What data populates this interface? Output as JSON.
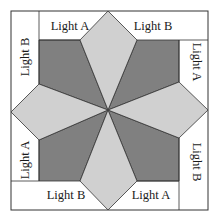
{
  "diagram": {
    "type": "quilt-block-template",
    "colors": {
      "background": "#ffffff",
      "dark": "#808080",
      "light": "#d0d0d0",
      "white_piece": "#ffffff",
      "stroke": "#333333"
    },
    "labels": {
      "top_left": "Light A",
      "top_right": "Light B",
      "right_top": "Light A",
      "right_bottom": "Light B",
      "bottom_right": "Light A",
      "bottom_left": "Light B",
      "left_bottom": "Light A",
      "left_top": "Light B"
    }
  }
}
